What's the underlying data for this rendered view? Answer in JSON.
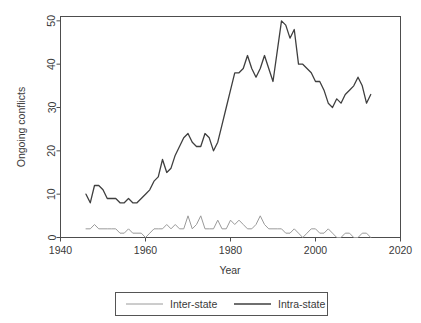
{
  "chart_data": {
    "type": "line",
    "title": "",
    "xlabel": "Year",
    "ylabel": "Ongoing conflicts",
    "xlim": [
      1940,
      2020
    ],
    "ylim": [
      0,
      51
    ],
    "xticks": [
      1940,
      1960,
      1980,
      2000,
      2020
    ],
    "xtick_labels": [
      "1940",
      "1960",
      "1980",
      "2000",
      "2020"
    ],
    "yticks": [
      0,
      10,
      20,
      30,
      40,
      50
    ],
    "ytick_labels": [
      "0",
      "10",
      "20",
      "30",
      "40",
      "50"
    ],
    "grid": false,
    "legend_position": "bottom",
    "x": [
      1946,
      1947,
      1948,
      1949,
      1950,
      1951,
      1952,
      1953,
      1954,
      1955,
      1956,
      1957,
      1958,
      1959,
      1960,
      1961,
      1962,
      1963,
      1964,
      1965,
      1966,
      1967,
      1968,
      1969,
      1970,
      1971,
      1972,
      1973,
      1974,
      1975,
      1976,
      1977,
      1978,
      1979,
      1980,
      1981,
      1982,
      1983,
      1984,
      1985,
      1986,
      1987,
      1988,
      1989,
      1990,
      1991,
      1992,
      1993,
      1994,
      1995,
      1996,
      1997,
      1998,
      1999,
      2000,
      2001,
      2002,
      2003,
      2004,
      2005,
      2006,
      2007,
      2008,
      2009,
      2010,
      2011,
      2012,
      2013
    ],
    "series": [
      {
        "name": "Inter-state",
        "color": "#9a9a9a",
        "width": 1.0,
        "values": [
          2,
          2,
          3,
          2,
          2,
          2,
          2,
          2,
          1,
          1,
          2,
          1,
          1,
          1,
          0,
          1,
          2,
          2,
          2,
          3,
          2,
          3,
          2,
          2,
          5,
          2,
          3,
          5,
          2,
          2,
          2,
          4,
          2,
          2,
          4,
          3,
          4,
          3,
          2,
          2,
          3,
          5,
          3,
          2,
          2,
          2,
          2,
          1,
          1,
          2,
          1,
          0,
          1,
          2,
          2,
          1,
          1,
          2,
          1,
          0,
          0,
          1,
          1,
          0,
          0,
          1,
          1,
          0
        ]
      },
      {
        "name": "Intra-state",
        "color": "#3f3f3f",
        "width": 1.3,
        "values": [
          10,
          8,
          12,
          12,
          11,
          9,
          9,
          9,
          8,
          8,
          9,
          8,
          8,
          9,
          10,
          11,
          13,
          14,
          18,
          15,
          16,
          19,
          21,
          23,
          24,
          22,
          21,
          21,
          24,
          23,
          20,
          22,
          26,
          30,
          34,
          38,
          38,
          39,
          42,
          39,
          37,
          39,
          42,
          39,
          36,
          43,
          50,
          49,
          46,
          48,
          40,
          40,
          39,
          38,
          36,
          36,
          34,
          31,
          30,
          32,
          31,
          33,
          34,
          35,
          37,
          35,
          31,
          33
        ]
      }
    ]
  },
  "legend": {
    "entries": [
      {
        "label": "Inter-state",
        "color": "#9a9a9a"
      },
      {
        "label": "Intra-state",
        "color": "#3f3f3f"
      }
    ]
  }
}
